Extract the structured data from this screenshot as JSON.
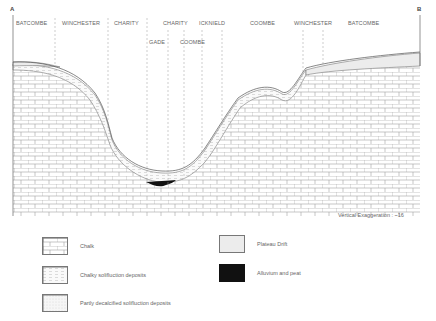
{
  "section": {
    "end_left": "A",
    "end_right": "B",
    "vertical_exaggeration": "Vertical Exaggeration : ~16",
    "top_labels": [
      {
        "text": "BATCOMBE",
        "x": 16,
        "y": 22
      },
      {
        "text": "WINCHESTER",
        "x": 62,
        "y": 22
      },
      {
        "text": "CHARITY",
        "x": 114,
        "y": 22
      },
      {
        "text": "CHARITY",
        "x": 163,
        "y": 22
      },
      {
        "text": "ICKNIELD",
        "x": 199,
        "y": 22
      },
      {
        "text": "COOMBE",
        "x": 250,
        "y": 22
      },
      {
        "text": "WINCHESTER",
        "x": 294,
        "y": 22
      },
      {
        "text": "BATCOMBE",
        "x": 348,
        "y": 22
      },
      {
        "text": "GADE",
        "x": 149,
        "y": 41
      },
      {
        "text": "COOMBE",
        "x": 180,
        "y": 41
      }
    ],
    "divider_lines_x": [
      55,
      108,
      147,
      168,
      184,
      202,
      222,
      303,
      323
    ]
  },
  "legend": [
    {
      "label": "Chalk",
      "pattern": "chalk"
    },
    {
      "label": "Chalky solifluction deposits",
      "pattern": "chalky"
    },
    {
      "label": "Partly decalcified solifluction deposits",
      "pattern": "decalcified"
    },
    {
      "label": "Plateau Drift",
      "pattern": "plateau"
    },
    {
      "label": "Alluvium and peat",
      "pattern": "alluvium"
    }
  ],
  "colors": {
    "chalk_line": "#9a9a9a",
    "plateau_fill": "#ececec",
    "alluvium_fill": "#111111",
    "outline": "#666666"
  }
}
